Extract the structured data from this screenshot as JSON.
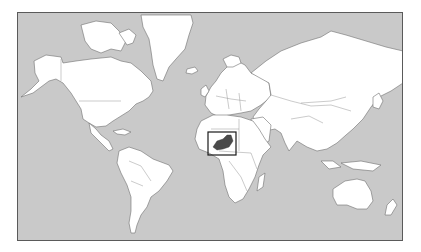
{
  "map": {
    "projection": "mercator",
    "title": "World locator map",
    "highlighted_country": "Niger",
    "colors": {
      "ocean": "#c9c9c9",
      "land": "#ffffff",
      "highlight": "#4a4a4a",
      "frame": "#5a5a5a",
      "locator_box": "#1a1a1a"
    },
    "locator_box": {
      "x": 207,
      "y": 131,
      "width": 28,
      "height": 23
    }
  }
}
